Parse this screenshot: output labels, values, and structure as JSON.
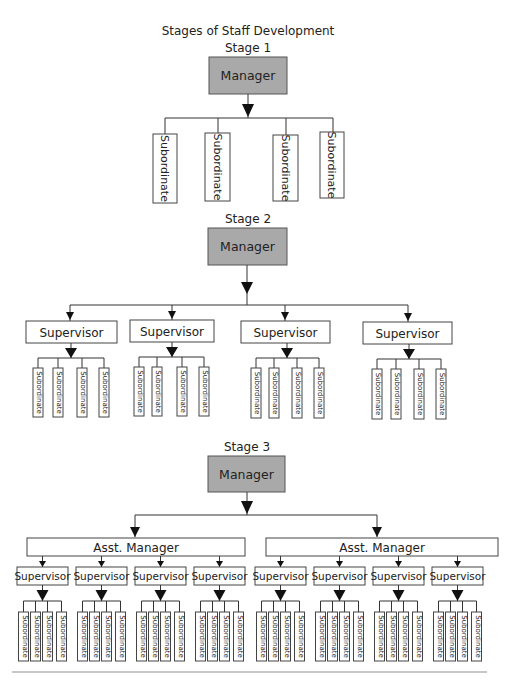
{
  "title": "Stages of Staff Development",
  "colors": {
    "manager_fill": "#a9a9a9",
    "box_fill": "#ffffff",
    "line": "#333333",
    "divider": "#b5b5b5"
  },
  "stage1": {
    "label": "Stage 1",
    "manager": "Manager",
    "subordinates": [
      "Subordinate",
      "Subordinate",
      "Subordinate",
      "Subordinate"
    ]
  },
  "stage2": {
    "label": "Stage 2",
    "manager": "Manager",
    "supervisors": [
      {
        "label": "Supervisor",
        "subordinates": [
          "Subordinate",
          "Subordinate",
          "Subordinate",
          "Subordinate"
        ]
      },
      {
        "label": "Supervisor",
        "subordinates": [
          "Subordinate",
          "Subordinate",
          "Subordinate",
          "Subordinate"
        ]
      },
      {
        "label": "Supervisor",
        "subordinates": [
          "Subordinate",
          "Subordinate",
          "Subordinate",
          "Subordinate"
        ]
      },
      {
        "label": "Supervisor",
        "subordinates": [
          "Subordinate",
          "Subordinate",
          "Subordinate",
          "Subordinate"
        ]
      }
    ]
  },
  "stage3": {
    "label": "Stage 3",
    "manager": "Manager",
    "asst_managers": [
      {
        "label": "Asst. Manager",
        "supervisors": [
          {
            "label": "Supervisor",
            "subordinates": [
              "Subordinate",
              "Subordinate",
              "Subordinate",
              "Subordinate"
            ]
          },
          {
            "label": "Supervisor",
            "subordinates": [
              "Subordinate",
              "Subordinate",
              "Subordinate",
              "Subordinate"
            ]
          },
          {
            "label": "Supervisor",
            "subordinates": [
              "Subordinate",
              "Subordinate",
              "Subordinate",
              "Subordinate"
            ]
          },
          {
            "label": "Supervisor",
            "subordinates": [
              "Subordinate",
              "Subordinate",
              "Subordinate",
              "Subordinate"
            ]
          }
        ]
      },
      {
        "label": "Asst. Manager",
        "supervisors": [
          {
            "label": "Supervisor",
            "subordinates": [
              "Subordinate",
              "Subordinate",
              "Subordinate",
              "Subordinate"
            ]
          },
          {
            "label": "Supervisor",
            "subordinates": [
              "Subordinate",
              "Subordinate",
              "Subordinate",
              "Subordinate"
            ]
          },
          {
            "label": "Supervisor",
            "subordinates": [
              "Subordinate",
              "Subordinate",
              "Subordinate",
              "Subordinate"
            ]
          },
          {
            "label": "Supervisor",
            "subordinates": [
              "Subordinate",
              "Subordinate",
              "Subordinate",
              "Subordinate"
            ]
          }
        ]
      }
    ]
  }
}
